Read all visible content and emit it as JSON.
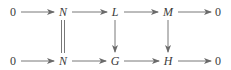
{
  "diagram": {
    "type": "commutative-diagram",
    "top_row": {
      "nodes": [
        {
          "id": "t0",
          "label": "0",
          "italic": false,
          "x": 13,
          "y": 12
        },
        {
          "id": "tN",
          "label": "N",
          "italic": true,
          "x": 63,
          "y": 12
        },
        {
          "id": "tL",
          "label": "L",
          "italic": true,
          "x": 115,
          "y": 12
        },
        {
          "id": "tM",
          "label": "M",
          "italic": true,
          "x": 168,
          "y": 12
        },
        {
          "id": "t0r",
          "label": "0",
          "italic": false,
          "x": 218,
          "y": 12
        }
      ]
    },
    "bottom_row": {
      "nodes": [
        {
          "id": "b0",
          "label": "0",
          "italic": false,
          "x": 13,
          "y": 61
        },
        {
          "id": "bN",
          "label": "N",
          "italic": true,
          "x": 63,
          "y": 61
        },
        {
          "id": "bG",
          "label": "G",
          "italic": true,
          "x": 115,
          "y": 61
        },
        {
          "id": "bH",
          "label": "H",
          "italic": true,
          "x": 168,
          "y": 61
        },
        {
          "id": "b0r",
          "label": "0",
          "italic": false,
          "x": 218,
          "y": 61
        }
      ]
    },
    "arrows": [
      {
        "from": "0",
        "to": "N",
        "row": "top",
        "kind": "right"
      },
      {
        "from": "N",
        "to": "L",
        "row": "top",
        "kind": "right"
      },
      {
        "from": "L",
        "to": "M",
        "row": "top",
        "kind": "right"
      },
      {
        "from": "M",
        "to": "0",
        "row": "top",
        "kind": "right"
      },
      {
        "from": "0",
        "to": "N",
        "row": "bottom",
        "kind": "right"
      },
      {
        "from": "N",
        "to": "G",
        "row": "bottom",
        "kind": "right"
      },
      {
        "from": "G",
        "to": "H",
        "row": "bottom",
        "kind": "right"
      },
      {
        "from": "H",
        "to": "0",
        "row": "bottom",
        "kind": "right"
      },
      {
        "from": "N",
        "to": "N",
        "column": "N",
        "kind": "equality"
      },
      {
        "from": "L",
        "to": "G",
        "column": "L/G",
        "kind": "down"
      },
      {
        "from": "M",
        "to": "H",
        "column": "M/H",
        "kind": "down"
      }
    ],
    "colors": {
      "text": "#3a3a3a",
      "arrow": "#6a6a6a",
      "background": "#ffffff"
    }
  }
}
